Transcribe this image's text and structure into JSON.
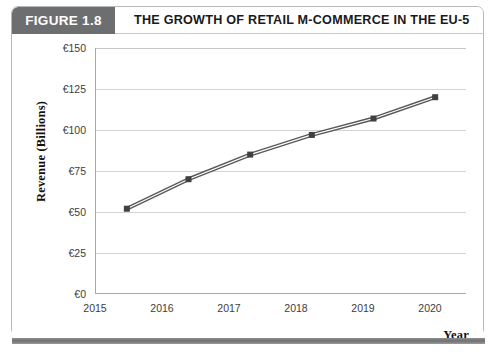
{
  "figure": {
    "number_label": "FIGURE 1.8",
    "title": "THE GROWTH OF RETAIL M-COMMERCE IN THE EU-5"
  },
  "colors": {
    "header_block_bg": "#6d6e70",
    "header_block_text": "#ffffff",
    "title_text": "#1a1a1a",
    "gridline": "#d0d0d0",
    "axis_line": "#a8a8a8",
    "series_line": "#58595b",
    "marker_fill": "#404041",
    "card_border": "#b9b9b9",
    "bottom_rule": "#6f7072"
  },
  "chart_data": {
    "type": "line",
    "title": "THE GROWTH OF RETAIL M-COMMERCE IN THE EU-5",
    "xlabel": "Year",
    "ylabel": "Revenue (Billions)",
    "categories": [
      "2015",
      "2016",
      "2017",
      "2018",
      "2019",
      "2020"
    ],
    "x": [
      2015,
      2016,
      2017,
      2018,
      2019,
      2020
    ],
    "values": [
      52,
      70,
      85,
      97,
      107,
      120
    ],
    "series": [
      {
        "name": "Retail m-commerce revenue",
        "values": [
          52,
          70,
          85,
          97,
          107,
          120
        ]
      }
    ],
    "ylim": [
      0,
      150
    ],
    "ytick_values": [
      0,
      25,
      50,
      75,
      100,
      125,
      150
    ],
    "ytick_labels": [
      "€0",
      "€25",
      "€50",
      "€75",
      "€100",
      "€125",
      "€150"
    ],
    "xtick_labels": [
      "2015",
      "2016",
      "2017",
      "2018",
      "2019",
      "2020"
    ],
    "grid": true,
    "grid_axis": "y",
    "legend": false,
    "legend_position": "none",
    "marker": "square",
    "line_style": "double-line"
  },
  "axes": {
    "y_title": "Revenue (Billions)",
    "x_title": "Year",
    "y_labels": [
      "€150",
      "€125",
      "€100",
      "€75",
      "€50",
      "€25",
      "€0"
    ],
    "x_labels": [
      "2015",
      "2016",
      "2017",
      "2018",
      "2019",
      "2020"
    ]
  }
}
